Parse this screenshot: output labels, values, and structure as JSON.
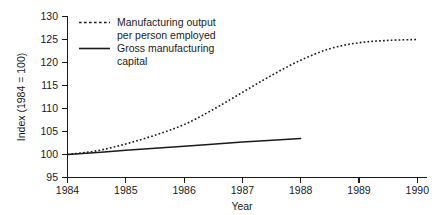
{
  "chart_data": {
    "type": "line",
    "title": "",
    "xlabel": "Year",
    "ylabel": "Index (1984 = 100)",
    "xlim": [
      1984,
      1990
    ],
    "ylim": [
      95,
      130
    ],
    "xticks": [
      "1984",
      "1985",
      "1986",
      "1987",
      "1988",
      "1989",
      "1990"
    ],
    "yticks": [
      "95",
      "100",
      "105",
      "110",
      "115",
      "120",
      "125",
      "130"
    ],
    "grid": false,
    "legend_position": "upper-left-inside",
    "series": [
      {
        "name": "Manufacturing output per person employed",
        "style": "dotted",
        "color": "#1a1a1a",
        "x": [
          1984,
          1984.5,
          1985,
          1985.5,
          1986,
          1986.5,
          1987,
          1987.5,
          1988,
          1988.5,
          1989,
          1989.5,
          1990
        ],
        "values": [
          100,
          100.8,
          102.3,
          104.2,
          106.5,
          109.8,
          113.5,
          117.2,
          120.5,
          123.0,
          124.3,
          124.8,
          125.0
        ]
      },
      {
        "name": "Gross manufacturing capital",
        "style": "solid",
        "color": "#1a1a1a",
        "x": [
          1984,
          1985,
          1986,
          1987,
          1988
        ],
        "values": [
          100,
          100.9,
          101.8,
          102.7,
          103.5
        ]
      }
    ],
    "legend": [
      {
        "style": "dotted",
        "line1": "Manufacturing output",
        "line2": "per person employed"
      },
      {
        "style": "solid",
        "line1": "Gross manufacturing",
        "line2": "capital"
      }
    ]
  }
}
